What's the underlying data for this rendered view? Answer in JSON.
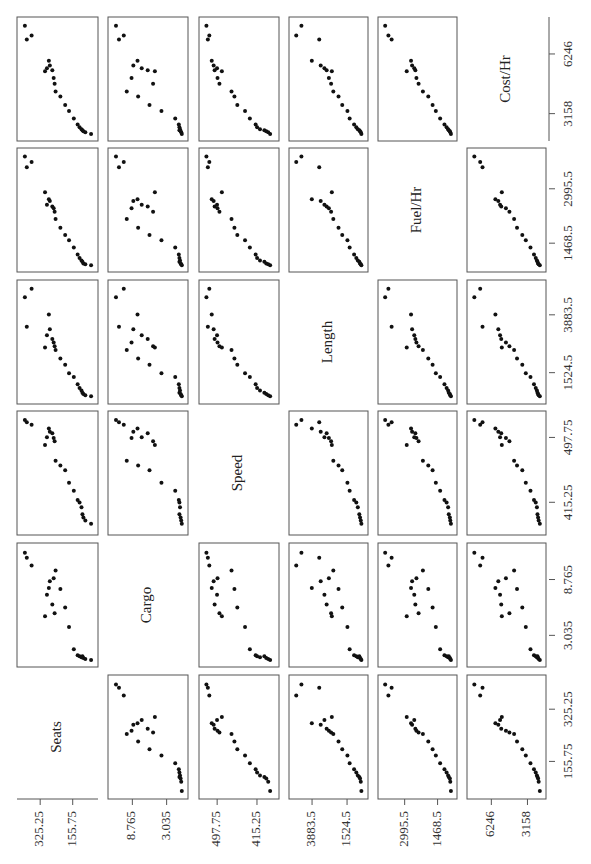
{
  "chart_data": {
    "type": "scatter",
    "subtype": "scatterplot-matrix",
    "orientation": "rotated 90 degrees counter-clockwise",
    "title": "",
    "variables": [
      "Seats",
      "Cargo",
      "Speed",
      "Length",
      "Fuel/Hr",
      "Cost/Hr"
    ],
    "axis_ticks": {
      "Seats": {
        "labels": [
          "325.25",
          "155.75"
        ],
        "values": [
          325.25,
          155.75
        ]
      },
      "Cargo": {
        "labels": [
          "8.765",
          "3.035"
        ],
        "values": [
          8.765,
          3.035
        ]
      },
      "Speed": {
        "labels": [
          "497.75",
          "415.25"
        ],
        "values": [
          497.75,
          415.25
        ]
      },
      "Length": {
        "labels": [
          "3883.5",
          "1524.5"
        ],
        "values": [
          3883.5,
          1524.5
        ]
      },
      "Fuel/Hr": {
        "labels": [
          "2995.5",
          "1468.5"
        ],
        "values": [
          2995.5,
          1468.5
        ]
      },
      "Cost/Hr": {
        "labels": [
          "6246",
          "3158"
        ],
        "values": [
          6246,
          3158
        ]
      }
    },
    "observations": [
      {
        "Seats": 405,
        "Cargo": 11.5,
        "Speed": 520,
        "Length": 4600,
        "Fuel/Hr": 3900,
        "Cost/Hr": 7700
      },
      {
        "Seats": 370,
        "Cargo": 10.2,
        "Speed": 514,
        "Length": 4950,
        "Fuel/Hr": 3750,
        "Cost/Hr": 7200
      },
      {
        "Seats": 395,
        "Cargo": 11.0,
        "Speed": 517,
        "Length": 3400,
        "Fuel/Hr": 3600,
        "Cost/Hr": 7000
      },
      {
        "Seats": 280,
        "Cargo": 7.9,
        "Speed": 509,
        "Length": 3900,
        "Fuel/Hr": 2700,
        "Cost/Hr": 5900
      },
      {
        "Seats": 275,
        "Cargo": 8.6,
        "Speed": 505,
        "Length": 3300,
        "Fuel/Hr": 2650,
        "Cost/Hr": 5650
      },
      {
        "Seats": 262,
        "Cargo": 6.2,
        "Speed": 503,
        "Length": 2900,
        "Fuel/Hr": 2500,
        "Cost/Hr": 5400
      },
      {
        "Seats": 290,
        "Cargo": 7.2,
        "Speed": 498,
        "Length": 3050,
        "Fuel/Hr": 2550,
        "Cost/Hr": 5500
      },
      {
        "Seats": 255,
        "Cargo": 8.9,
        "Speed": 497,
        "Length": 2750,
        "Fuel/Hr": 2450,
        "Cost/Hr": 5000
      },
      {
        "Seats": 250,
        "Cargo": 5.3,
        "Speed": 493,
        "Length": 2600,
        "Fuel/Hr": 2350,
        "Cost/Hr": 4700
      },
      {
        "Seats": 300,
        "Cargo": 5.0,
        "Speed": 488,
        "Length": 2550,
        "Fuel/Hr": 2900,
        "Cost/Hr": 5350
      },
      {
        "Seats": 245,
        "Cargo": 9.7,
        "Speed": 468,
        "Length": 2450,
        "Fuel/Hr": 2150,
        "Cost/Hr": 4300
      },
      {
        "Seats": 220,
        "Cargo": 7.8,
        "Speed": 462,
        "Length": 2100,
        "Fuel/Hr": 1900,
        "Cost/Hr": 4050
      },
      {
        "Seats": 195,
        "Cargo": 5.9,
        "Speed": 456,
        "Length": 1850,
        "Fuel/Hr": 1700,
        "Cost/Hr": 3600
      },
      {
        "Seats": 175,
        "Cargo": 3.9,
        "Speed": 440,
        "Length": 1500,
        "Fuel/Hr": 1550,
        "Cost/Hr": 3300
      },
      {
        "Seats": 150,
        "Cargo": 1.6,
        "Speed": 430,
        "Length": 1350,
        "Fuel/Hr": 1350,
        "Cost/Hr": 2900
      },
      {
        "Seats": 130,
        "Cargo": 1.0,
        "Speed": 418,
        "Length": 1050,
        "Fuel/Hr": 1150,
        "Cost/Hr": 2600
      },
      {
        "Seats": 120,
        "Cargo": 0.9,
        "Speed": 415,
        "Length": 900,
        "Fuel/Hr": 1050,
        "Cost/Hr": 2450
      },
      {
        "Seats": 110,
        "Cargo": 0.8,
        "Speed": 409,
        "Length": 800,
        "Fuel/Hr": 980,
        "Cost/Hr": 2350
      },
      {
        "Seats": 105,
        "Cargo": 0.9,
        "Speed": 400,
        "Length": 700,
        "Fuel/Hr": 950,
        "Cost/Hr": 2300
      },
      {
        "Seats": 100,
        "Cargo": 0.7,
        "Speed": 396,
        "Length": 650,
        "Fuel/Hr": 900,
        "Cost/Hr": 2250
      },
      {
        "Seats": 90,
        "Cargo": 0.6,
        "Speed": 392,
        "Length": 600,
        "Fuel/Hr": 880,
        "Cost/Hr": 2200
      },
      {
        "Seats": 60,
        "Cargo": 0.5,
        "Speed": 388,
        "Length": 560,
        "Fuel/Hr": 850,
        "Cost/Hr": 2100
      }
    ],
    "ranges": {
      "Seats": [
        50,
        420
      ],
      "Cargo": [
        0.3,
        12.0
      ],
      "Speed": [
        380,
        525
      ],
      "Length": [
        450,
        5100
      ],
      "Fuel/Hr": [
        800,
        4000
      ],
      "Cost/Hr": [
        2000,
        7900
      ]
    },
    "grid": false,
    "legend": null
  },
  "layout": {
    "columns_x": [
      [
        17,
        98
      ],
      [
        108,
        188
      ],
      [
        199,
        279
      ],
      [
        289,
        368
      ],
      [
        378,
        457
      ],
      [
        467,
        546
      ]
    ],
    "rows_y": [
      [
        17,
        141
      ],
      [
        148,
        272
      ],
      [
        280,
        404
      ],
      [
        411,
        535
      ],
      [
        543,
        667
      ],
      [
        675,
        799
      ]
    ]
  }
}
